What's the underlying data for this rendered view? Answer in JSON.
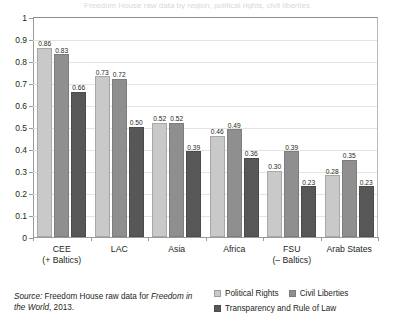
{
  "figure": {
    "clipped_title": "Freedom House raw data by region, political rights, civil liberties"
  },
  "source_note": {
    "label": "Source:",
    "text_part1": " Freedom House raw data for ",
    "italic_part": "Freedom in the World",
    "text_part2": ", 2013."
  },
  "legend": {
    "items": [
      {
        "label": "Political Rights",
        "color": "#c9c9c9"
      },
      {
        "label": "Civil Liberties",
        "color": "#8f8f8f"
      },
      {
        "label": "Transparency and Rule of Law",
        "color": "#575757"
      }
    ]
  },
  "chart_data": {
    "type": "bar",
    "title": "",
    "xlabel": "",
    "ylabel": "",
    "ylim": [
      0,
      1
    ],
    "yticks": [
      "0",
      "0.1",
      "0.2",
      "0.3",
      "0.4",
      "0.5",
      "0.6",
      "0.7",
      "0.8",
      "0.9",
      "1"
    ],
    "grid": true,
    "legend_position": "bottom-right",
    "categories": [
      "CEE\n(+ Baltics)",
      "LAC",
      "Asia",
      "Africa",
      "FSU\n(– Baltics)",
      "Arab States"
    ],
    "category_labels": [
      {
        "line1": "CEE",
        "line2": "(+ Baltics)"
      },
      {
        "line1": "LAC",
        "line2": ""
      },
      {
        "line1": "Asia",
        "line2": ""
      },
      {
        "line1": "Africa",
        "line2": ""
      },
      {
        "line1": "FSU",
        "line2": "(– Baltics)"
      },
      {
        "line1": "Arab States",
        "line2": ""
      }
    ],
    "series": [
      {
        "name": "Political Rights",
        "color": "#c9c9c9",
        "values": [
          0.86,
          0.73,
          0.52,
          0.46,
          0.3,
          0.28
        ],
        "labels": [
          "0.86",
          "0.73",
          "0.52",
          "0.46",
          "0.30",
          "0.28"
        ]
      },
      {
        "name": "Civil Liberties",
        "color": "#8f8f8f",
        "values": [
          0.83,
          0.72,
          0.52,
          0.49,
          0.39,
          0.35
        ],
        "labels": [
          "0.83",
          "0.72",
          "0.52",
          "0.49",
          "0.39",
          "0.35"
        ]
      },
      {
        "name": "Transparency and Rule of Law",
        "color": "#575757",
        "values": [
          0.66,
          0.5,
          0.39,
          0.36,
          0.23,
          0.23
        ],
        "labels": [
          "0.66",
          "0.50",
          "0.39",
          "0.36",
          "0.23",
          "0.23"
        ]
      }
    ]
  }
}
